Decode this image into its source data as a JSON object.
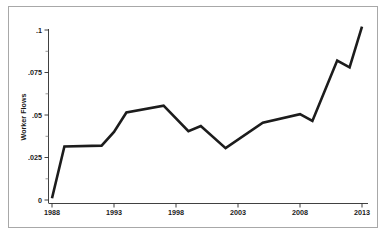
{
  "chart_data": {
    "type": "line",
    "title": "",
    "xlabel": "",
    "ylabel": "Worker Flows",
    "xlim": [
      1988,
      2013
    ],
    "ylim": [
      0,
      0.1
    ],
    "grid": false,
    "legend": null,
    "x_tick_labels": [
      "1988",
      "1993",
      "1998",
      "2003",
      "2008",
      "2013"
    ],
    "x_tick_values": [
      1988,
      1993,
      1998,
      2003,
      2008,
      2013
    ],
    "y_tick_labels": [
      "0",
      ".025",
      ".05",
      ".075",
      ".1"
    ],
    "y_tick_values": [
      0,
      0.025,
      0.05,
      0.075,
      0.1
    ],
    "x": [
      1988,
      1989,
      1992,
      1993,
      1994,
      1997,
      1999,
      2000,
      2002,
      2005,
      2008,
      2009,
      2011,
      2012,
      2013
    ],
    "values": [
      0.001,
      0.0315,
      0.032,
      0.04,
      0.0515,
      0.0555,
      0.0405,
      0.0435,
      0.0305,
      0.0455,
      0.0505,
      0.0465,
      0.082,
      0.078,
      0.102
    ],
    "series": [
      {
        "name": "Worker Flows",
        "color": "#1c1c1c",
        "values": [
          0.001,
          0.0315,
          0.032,
          0.04,
          0.0515,
          0.0555,
          0.0405,
          0.0435,
          0.0305,
          0.0455,
          0.0505,
          0.0465,
          0.082,
          0.078,
          0.102
        ]
      }
    ]
  },
  "caption": {
    "text": ""
  }
}
